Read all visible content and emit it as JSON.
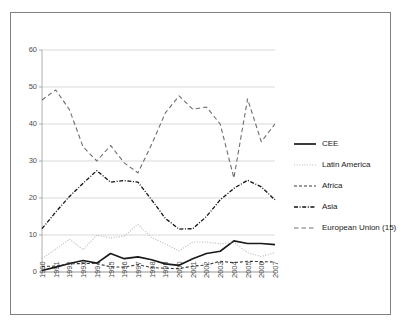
{
  "chart_data": {
    "type": "line",
    "title": "",
    "subtitle": "",
    "xlabel": "",
    "ylabel": "",
    "grid": true,
    "legend_position": "right",
    "xlim": [
      1990,
      2007
    ],
    "ylim": [
      0,
      60
    ],
    "yticks": [
      0,
      10,
      20,
      30,
      40,
      50,
      60
    ],
    "categories": [
      "1990",
      "1991",
      "1992",
      "1993",
      "1994",
      "1995",
      "1996",
      "1997",
      "1998",
      "1999",
      "2000",
      "2001",
      "2002",
      "2003",
      "2004",
      "2005",
      "2006",
      "2007"
    ],
    "series": [
      {
        "name": "CEE",
        "style": "solid",
        "color": "#1a1a1a",
        "values": [
          0.4,
          1.3,
          2.3,
          3.1,
          2.4,
          5.0,
          3.6,
          4.1,
          3.3,
          2.2,
          1.8,
          3.6,
          5.0,
          5.6,
          8.4,
          7.7,
          7.7,
          7.4
        ]
      },
      {
        "name": "Latin America",
        "style": "dotted",
        "color": "#b5b5b5",
        "values": [
          3.6,
          6.2,
          8.9,
          6.0,
          10.0,
          9.2,
          9.7,
          12.9,
          9.3,
          7.6,
          5.7,
          8.1,
          8.1,
          7.6,
          8.0,
          5.2,
          4.2,
          5.2
        ]
      },
      {
        "name": "Africa",
        "style": "dashed",
        "color": "#3a3a3a",
        "values": [
          1.5,
          1.6,
          2.2,
          2.3,
          2.3,
          1.4,
          1.3,
          2.0,
          1.2,
          1.0,
          0.9,
          1.6,
          1.9,
          2.9,
          2.5,
          2.9,
          2.8,
          2.7
        ]
      },
      {
        "name": "Asia",
        "style": "dashdot",
        "color": "#111111",
        "values": [
          11.7,
          16.2,
          20.4,
          24.0,
          27.4,
          24.3,
          24.7,
          24.3,
          19.5,
          14.5,
          11.6,
          11.7,
          15.0,
          19.5,
          22.6,
          24.8,
          23.0,
          19.5
        ]
      },
      {
        "name": "European Union (15)",
        "style": "longdash",
        "color": "#6e6e6e",
        "values": [
          46.5,
          49.2,
          43.9,
          33.8,
          30.0,
          34.2,
          29.5,
          26.8,
          34.5,
          43.0,
          47.6,
          44.0,
          44.6,
          40.0,
          25.4,
          46.8,
          35.2,
          40.0
        ]
      }
    ]
  },
  "legend": {
    "items": [
      {
        "label": "CEE"
      },
      {
        "label": "Latin America"
      },
      {
        "label": "Africa"
      },
      {
        "label": "Asia"
      },
      {
        "label": "European Union (15)"
      }
    ]
  }
}
